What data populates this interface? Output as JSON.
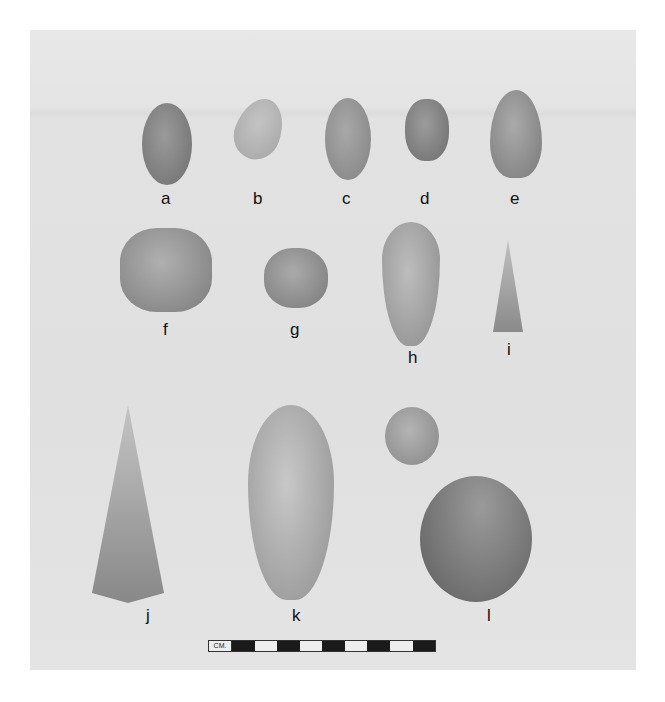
{
  "figure": {
    "type": "photograph",
    "labels": [
      "a",
      "b",
      "c",
      "d",
      "e",
      "f",
      "g",
      "h",
      "i",
      "j",
      "k",
      "l"
    ],
    "scale_bar": {
      "unit_label": "CM.",
      "segments": 10
    }
  }
}
